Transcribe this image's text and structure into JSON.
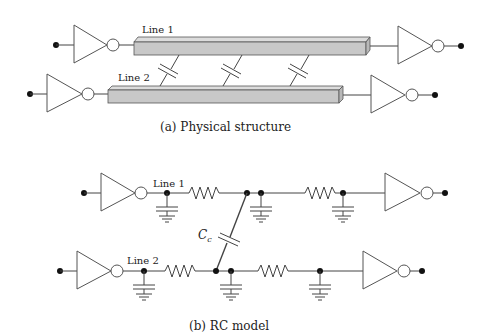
{
  "figure": {
    "part_a": {
      "caption": "(a) Physical structure",
      "line1_label": "Line 1",
      "line2_label": "Line 2",
      "coupling_capacitors": 3
    },
    "part_b": {
      "caption": "(b) RC model",
      "line1_label": "Line 1",
      "line2_label": "Line 2",
      "coupling_label": "C",
      "coupling_subscript": "c",
      "resistors_per_line": 2,
      "ground_caps_per_line": 3
    },
    "colors": {
      "wire": "#444444",
      "bar_fill": "#c8c8c8",
      "dot": "#111111"
    }
  }
}
